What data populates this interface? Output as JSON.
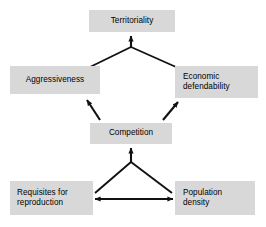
{
  "diagram": {
    "type": "flow-diagram",
    "background_color": "#ffffff",
    "node_fill_color": "#d8d8d8",
    "node_text_color": "#000000",
    "edge_color": "#111111",
    "nodes": [
      {
        "id": "territoriality",
        "label": "Territoriality"
      },
      {
        "id": "aggressiveness",
        "label": "Aggressiveness"
      },
      {
        "id": "economic-defendability",
        "label": "Economic\ndefendability"
      },
      {
        "id": "competition",
        "label": "Competition"
      },
      {
        "id": "requisites",
        "label": "Requisites for\nreproduction"
      },
      {
        "id": "population-density",
        "label": "Population\ndensity"
      }
    ],
    "edges": [
      {
        "id": "aggressiveness-to-apex",
        "from": "aggressiveness",
        "to": "apex-upper",
        "arrow": "none"
      },
      {
        "id": "economic-defendability-to-apex",
        "from": "economic-defendability",
        "to": "apex-upper",
        "arrow": "none"
      },
      {
        "id": "apex-to-territoriality",
        "from": "apex-upper",
        "to": "territoriality",
        "arrow": "single"
      },
      {
        "id": "competition-to-aggressiveness",
        "from": "competition",
        "to": "aggressiveness",
        "arrow": "single"
      },
      {
        "id": "competition-to-economic",
        "from": "competition",
        "to": "economic-defendability",
        "arrow": "single"
      },
      {
        "id": "apex-to-competition",
        "from": "apex-lower",
        "to": "competition",
        "arrow": "single"
      },
      {
        "id": "requisites-to-apex",
        "from": "requisites",
        "to": "apex-lower",
        "arrow": "none"
      },
      {
        "id": "population-density-to-apex",
        "from": "population-density",
        "to": "apex-lower",
        "arrow": "none"
      },
      {
        "id": "requisites-population-density",
        "from": "requisites",
        "to": "population-density",
        "arrow": "double"
      }
    ]
  }
}
